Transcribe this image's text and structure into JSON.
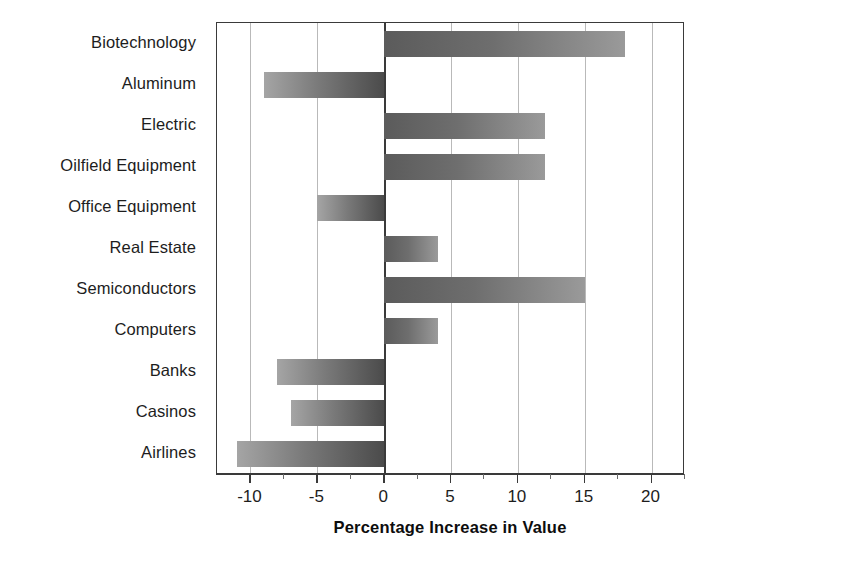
{
  "chart_data": {
    "type": "bar",
    "orientation": "horizontal",
    "title": "",
    "xlabel": "Percentage Increase in Value",
    "ylabel": "",
    "xlim": [
      -12.5,
      22.5
    ],
    "xticks": [
      -10,
      -5,
      0,
      5,
      10,
      15,
      20
    ],
    "xtick_labels": [
      "-10",
      "-5",
      "0",
      "10",
      "15",
      "20"
    ],
    "minor_ticks": [
      -7.5,
      -2.5,
      2.5,
      7.5,
      12.5,
      17.5,
      22.5
    ],
    "grid": true,
    "grid_axis": "x",
    "legend": null,
    "categories": [
      "Biotechnology",
      "Aluminum",
      "Electric",
      "Oilfield Equipment",
      "Office Equipment",
      "Real Estate",
      "Semiconductors",
      "Computers",
      "Banks",
      "Casinos",
      "Airlines"
    ],
    "values": [
      18,
      -9,
      12,
      12,
      -5,
      4,
      15,
      4,
      -8,
      -7,
      -11
    ],
    "bar_colors": {
      "positive_start": "#5b5b5b",
      "positive_end": "#9a9a9a",
      "negative_start": "#a5a5a5",
      "negative_end": "#4b4b4b"
    },
    "frame_color": "#3a3a3a",
    "gridline_color": "#b9b9b9"
  },
  "axis": {
    "x_title": "Percentage Increase in Value",
    "tick_labels": [
      {
        "value": -10,
        "text": "-10"
      },
      {
        "value": -5,
        "text": "-5"
      },
      {
        "value": 0,
        "text": "0"
      },
      {
        "value": 5,
        "text": "5"
      },
      {
        "value": 10,
        "text": "10"
      },
      {
        "value": 15,
        "text": "15"
      },
      {
        "value": 20,
        "text": "20"
      }
    ]
  }
}
